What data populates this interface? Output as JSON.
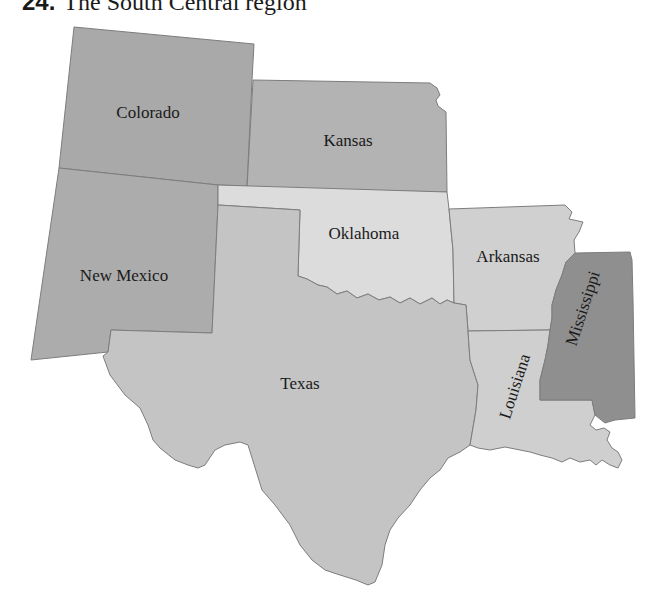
{
  "caption": {
    "number": "24.",
    "title": "The South Central region"
  },
  "map": {
    "region": "South Central",
    "states": [
      {
        "id": "colorado",
        "label": "Colorado",
        "fill": "#a9a9a9"
      },
      {
        "id": "kansas",
        "label": "Kansas",
        "fill": "#b3b3b3"
      },
      {
        "id": "new-mexico",
        "label": "New Mexico",
        "fill": "#acacac"
      },
      {
        "id": "oklahoma",
        "label": "Oklahoma",
        "fill": "#dcdcdc"
      },
      {
        "id": "arkansas",
        "label": "Arkansas",
        "fill": "#d0d0d0"
      },
      {
        "id": "texas",
        "label": "Texas",
        "fill": "#c4c4c4"
      },
      {
        "id": "louisiana",
        "label": "Louisiana",
        "fill": "#cfcfcf"
      },
      {
        "id": "mississippi",
        "label": "Mississippi",
        "fill": "#8f8f8f"
      }
    ]
  }
}
